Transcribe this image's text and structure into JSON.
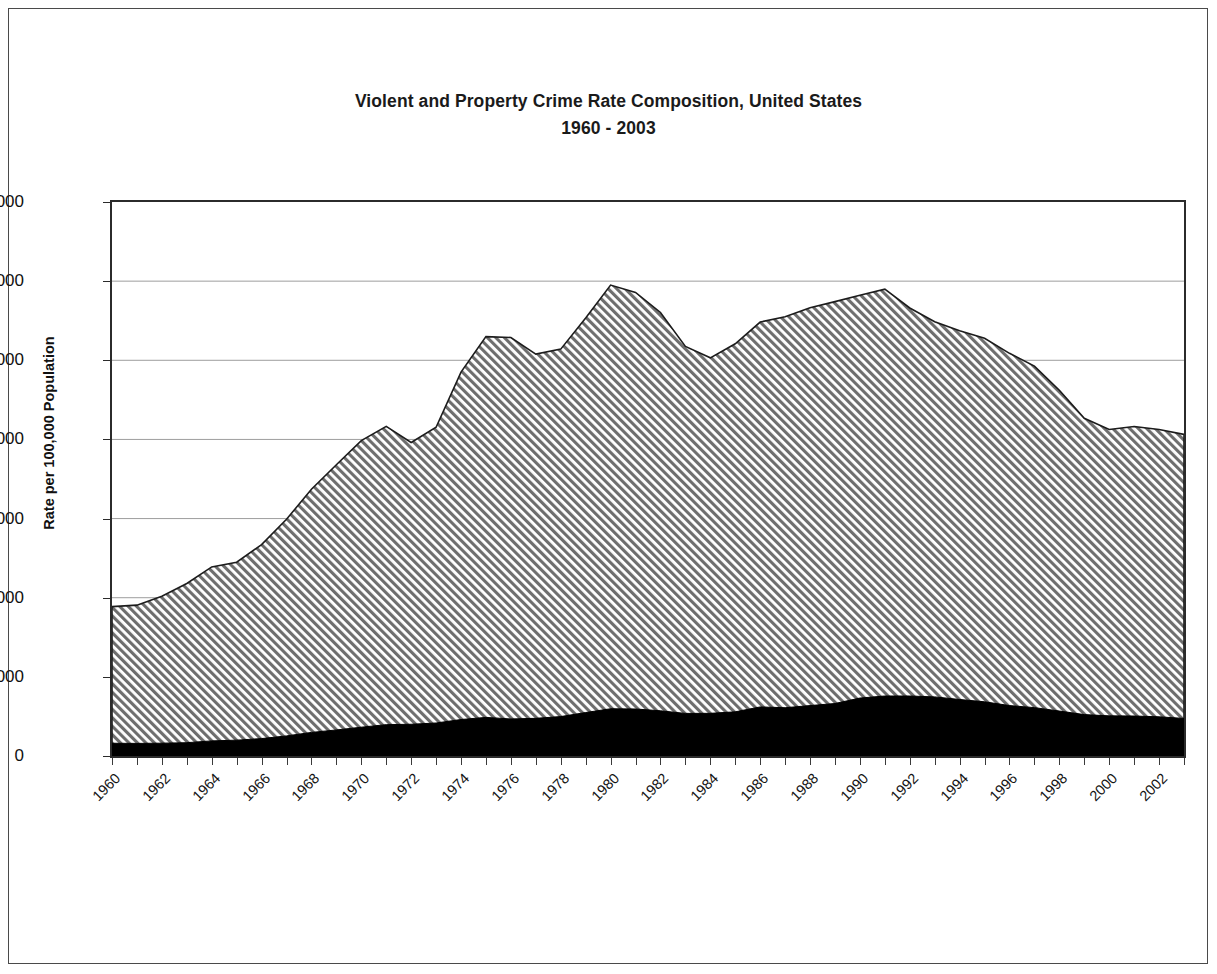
{
  "chart_data": {
    "type": "area",
    "stacked": true,
    "title": "Violent and Property Crime Rate Composition, United States",
    "subtitle": "1960 - 2003",
    "xlabel": "",
    "ylabel": "Rate per 100,000 Population",
    "ylim": [
      0,
      7000
    ],
    "xlim": [
      1960,
      2003
    ],
    "y_ticks": [
      0,
      1000,
      2000,
      3000,
      4000,
      5000,
      6000,
      7000
    ],
    "y_tick_labels": [
      "0",
      "1000",
      "2000",
      "3000",
      "4000",
      "5000",
      "6000",
      "7000"
    ],
    "grid": true,
    "grid_axis": "y",
    "legend": "none",
    "x": [
      1960,
      1961,
      1962,
      1963,
      1964,
      1965,
      1966,
      1967,
      1968,
      1969,
      1970,
      1971,
      1972,
      1973,
      1974,
      1975,
      1976,
      1977,
      1978,
      1979,
      1980,
      1981,
      1982,
      1983,
      1984,
      1985,
      1986,
      1987,
      1988,
      1989,
      1990,
      1991,
      1992,
      1993,
      1994,
      1995,
      1996,
      1997,
      1998,
      1999,
      2000,
      2001,
      2002,
      2003
    ],
    "x_tick_labels": [
      "1960",
      "1962",
      "1964",
      "1966",
      "1968",
      "1970",
      "1972",
      "1974",
      "1976",
      "1978",
      "1980",
      "1982",
      "1984",
      "1986",
      "1988",
      "1990",
      "1992",
      "1994",
      "1996",
      "1998",
      "2000",
      "2002"
    ],
    "series": [
      {
        "name": "Violent Crime Rate",
        "fill": "solid-black",
        "color": "#000000",
        "values": [
          161,
          159,
          162,
          168,
          191,
          200,
          220,
          254,
          298,
          329,
          364,
          396,
          401,
          417,
          461,
          488,
          468,
          476,
          498,
          549,
          597,
          594,
          571,
          538,
          539,
          558,
          620,
          610,
          637,
          663,
          732,
          758,
          758,
          747,
          714,
          685,
          637,
          611,
          568,
          523,
          507,
          505,
          495,
          475
        ]
      },
      {
        "name": "Property Crime Rate",
        "fill": "diagonal-hatch",
        "color": "#9a9a9a",
        "values": [
          1726,
          1747,
          1857,
          2012,
          2198,
          2249,
          2451,
          2737,
          3072,
          3351,
          3621,
          3769,
          3561,
          3737,
          4389,
          4811,
          4820,
          4602,
          4643,
          4986,
          5353,
          5264,
          5033,
          4637,
          4492,
          4651,
          4863,
          4940,
          5027,
          5078,
          5089,
          5140,
          4903,
          4740,
          4660,
          4593,
          4451,
          4316,
          4053,
          3744,
          3618,
          3658,
          3631,
          3588
        ]
      }
    ],
    "totals": [
      1887,
      1906,
      2019,
      2180,
      2389,
      2449,
      2671,
      2991,
      3370,
      3680,
      3985,
      4165,
      3962,
      4154,
      4850,
      5299,
      5288,
      5078,
      5141,
      5535,
      5950,
      5858,
      5604,
      5175,
      5031,
      5209,
      5483,
      5550,
      5664,
      5741,
      5821,
      5898,
      5661,
      5487,
      5374,
      5278,
      5088,
      4927,
      4621,
      4267,
      4125,
      4163,
      4126,
      4063
    ]
  }
}
